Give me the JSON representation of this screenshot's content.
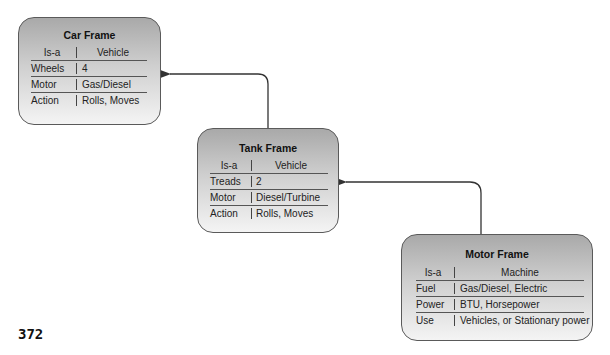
{
  "page_number": "372",
  "frames": [
    {
      "id": "car",
      "title": "Car Frame",
      "header": {
        "key": "Is-a",
        "value": "Vehicle"
      },
      "rows": [
        {
          "key": "Wheels",
          "value": "4"
        },
        {
          "key": "Motor",
          "value": "Gas/Diesel"
        },
        {
          "key": "Action",
          "value": "Rolls, Moves"
        }
      ]
    },
    {
      "id": "tank",
      "title": "Tank Frame",
      "header": {
        "key": "Is-a",
        "value": "Vehicle"
      },
      "rows": [
        {
          "key": "Treads",
          "value": "2"
        },
        {
          "key": "Motor",
          "value": "Diesel/Turbine"
        },
        {
          "key": "Action",
          "value": "Rolls, Moves"
        }
      ]
    },
    {
      "id": "motor",
      "title": "Motor Frame",
      "header": {
        "key": "Is-a",
        "value": "Machine"
      },
      "rows": [
        {
          "key": "Fuel",
          "value": "Gas/Diesel, Electric"
        },
        {
          "key": "Power",
          "value": "BTU, Horsepower"
        },
        {
          "key": "Use",
          "value": "Vehicles, or Stationary power"
        }
      ]
    }
  ],
  "connections": [
    {
      "from": "tank",
      "to": "car"
    },
    {
      "from": "motor",
      "to": "tank"
    }
  ],
  "colors": {
    "frame_top": "#a9a9a9",
    "frame_bottom": "#f4f4f4",
    "border": "#5a5a5a",
    "arrow": "#333333"
  }
}
